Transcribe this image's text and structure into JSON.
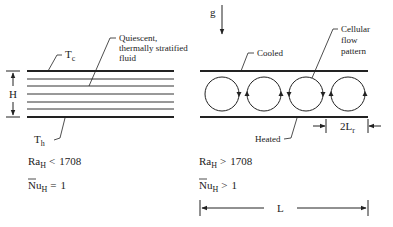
{
  "left_panel": {
    "top_plate_label": "T",
    "top_plate_sub": "c",
    "bottom_plate_label": "T",
    "bottom_plate_sub": "h",
    "fluid_label_lines": [
      "Quiescent,",
      "thermally stratified",
      "fluid"
    ],
    "height_label": "H",
    "rayleigh": {
      "symbol": "Ra",
      "sub": "H",
      "relation": "<",
      "value": "1708"
    },
    "nusselt": {
      "symbol": "Nu",
      "sub": "H",
      "relation": "=",
      "value": "1"
    }
  },
  "right_panel": {
    "gravity_label": "g",
    "top_plate_label": "Cooled",
    "bottom_plate_label": "Heated",
    "cell_label_lines": [
      "Cellular",
      "flow",
      "pattern"
    ],
    "cell_width_label": "2L",
    "cell_width_sub": "r",
    "rayleigh": {
      "symbol": "Ra",
      "sub": "H",
      "relation": ">",
      "value": "1708"
    },
    "nusselt": {
      "symbol": "Nu",
      "sub": "H",
      "relation": ">",
      "value": "1"
    },
    "length_label": "L",
    "cell_count": 4
  },
  "colors": {
    "ink": "#222222",
    "background": "#ffffff"
  }
}
